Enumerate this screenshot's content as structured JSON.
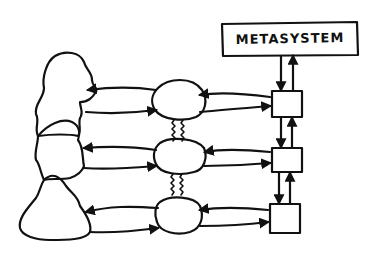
{
  "diagram": {
    "metasystem_label": "METASYSTEM",
    "colors": {
      "ink": "#111111",
      "background": "#ffffff"
    },
    "nodes": {
      "metasystem": {
        "label": "METASYSTEM"
      },
      "environments": 3,
      "operations": 3,
      "managements": 3
    },
    "rows": [
      {
        "id": "row-1"
      },
      {
        "id": "row-2"
      },
      {
        "id": "row-3"
      }
    ]
  }
}
